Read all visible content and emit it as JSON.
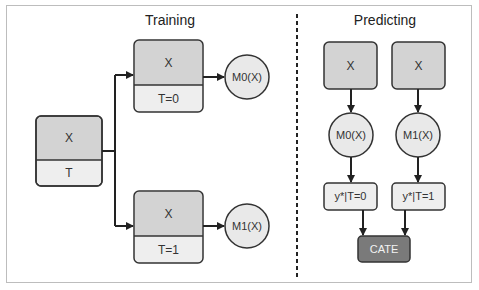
{
  "sections": {
    "training": {
      "title": "Training"
    },
    "predicting": {
      "title": "Predicting"
    }
  },
  "training": {
    "source_box": {
      "top": "X",
      "bottom": "T"
    },
    "treated_box_0": {
      "top": "X",
      "bottom": "T=0"
    },
    "treated_box_1": {
      "top": "X",
      "bottom": "T=1"
    },
    "model_0": "M0(X)",
    "model_1": "M1(X)"
  },
  "predicting": {
    "input_0": "X",
    "input_1": "X",
    "model_0": "M0(X)",
    "model_1": "M1(X)",
    "output_0": "y*|T=0",
    "output_1": "y*|T=1",
    "result": "CATE"
  },
  "colors": {
    "box_dark": "#d3d3d3",
    "box_light": "#eeeeee",
    "circle_fill": "#e9e9e9",
    "cate_fill": "#7a7a7a",
    "stroke": "#333333",
    "frame": "#bdbdbd"
  }
}
